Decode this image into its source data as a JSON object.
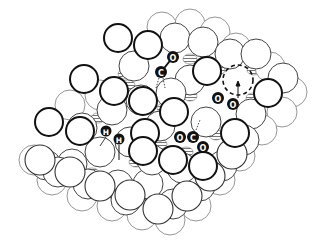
{
  "diagram": {
    "type": "surface-adsorption-illustration",
    "colors": {
      "background": "#ffffff",
      "atom_fill": "#ffffff",
      "atom_stroke": "#555555",
      "bold_atom_stroke": "#111111",
      "adsorbate_fill": "#111111",
      "adsorbate_label": "#ffffff",
      "hatch": "#777777"
    },
    "adsorbates": [
      {
        "name": "CO",
        "atoms": [
          {
            "label": "C",
            "x": 161,
            "y": 72
          },
          {
            "label": "O",
            "x": 173,
            "y": 57
          }
        ]
      },
      {
        "name": "O2-dissociated",
        "atoms": [
          {
            "label": "O",
            "x": 218,
            "y": 98
          },
          {
            "label": "O",
            "x": 233,
            "y": 104
          }
        ]
      },
      {
        "name": "CO2",
        "atoms": [
          {
            "label": "O",
            "x": 180,
            "y": 137
          },
          {
            "label": "C",
            "x": 193,
            "y": 137
          },
          {
            "label": "O",
            "x": 203,
            "y": 147
          }
        ]
      },
      {
        "name": "H",
        "atoms": [
          {
            "label": "H",
            "x": 106,
            "y": 131
          },
          {
            "label": "H",
            "x": 119,
            "y": 139
          }
        ]
      }
    ],
    "vacancy": {
      "x": 238,
      "y": 80,
      "r": 15,
      "style": "dashed"
    }
  }
}
